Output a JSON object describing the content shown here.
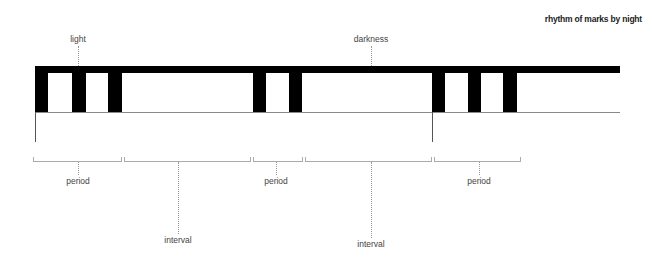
{
  "title": "rhythm of marks by night",
  "top_labels": [
    {
      "text": "light",
      "x": 78
    },
    {
      "text": "darkness",
      "x": 371
    }
  ],
  "bar": {
    "x_start": 35,
    "x_end": 620,
    "top": 66,
    "thickness": 7,
    "baseline_y": 112
  },
  "posts": [
    {
      "x": 35,
      "w": 13
    },
    {
      "x": 72,
      "w": 14
    },
    {
      "x": 108,
      "w": 14
    },
    {
      "x": 253,
      "w": 13
    },
    {
      "x": 289,
      "w": 13
    },
    {
      "x": 432,
      "w": 13
    },
    {
      "x": 468,
      "w": 13
    },
    {
      "x": 503,
      "w": 14
    }
  ],
  "cycle_markers": [
    35,
    432
  ],
  "brackets": [
    {
      "label": "period",
      "x1": 33,
      "x2": 121,
      "center": 78,
      "label_y": 176
    },
    {
      "label": "interval",
      "x1": 124,
      "x2": 250,
      "center": 178,
      "label_y": 235
    },
    {
      "label": "period",
      "x1": 253,
      "x2": 302,
      "center": 276,
      "label_y": 176
    },
    {
      "label": "interval",
      "x1": 305,
      "x2": 431,
      "center": 371,
      "label_y": 239
    },
    {
      "label": "period",
      "x1": 434,
      "x2": 520,
      "center": 479,
      "label_y": 176
    }
  ]
}
